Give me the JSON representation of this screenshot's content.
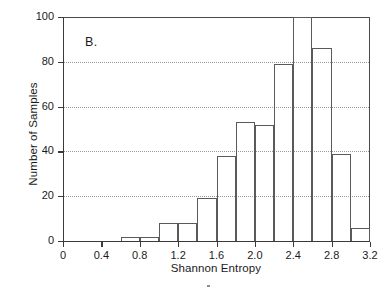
{
  "figure": {
    "panel_letter": "B.",
    "background_color": "#ffffff",
    "line_color": "#5a5a5a",
    "axis_color": "#3a3a3a",
    "grid_color": "#9a9a9a"
  },
  "chart_data": {
    "type": "bar",
    "title": "",
    "subtitle": "",
    "panel_label": "B.",
    "xlabel": "Shannon Entropy",
    "ylabel": "Number of Samples",
    "xlim": [
      0,
      3.2
    ],
    "ylim": [
      0,
      100
    ],
    "grid": true,
    "grid_axis": "y",
    "legend": "none",
    "bin_width": 0.2,
    "histogram_style": "outline-only, unfilled bars",
    "xticks": [
      0,
      0.4,
      0.8,
      1.2,
      1.6,
      2.0,
      2.4,
      2.8,
      3.2
    ],
    "xtick_labels": [
      "0",
      "0.4",
      "0.8",
      "1.2",
      "1.6",
      "2.0",
      "2.4",
      "2.8",
      "3.2"
    ],
    "yticks": [
      0,
      20,
      40,
      60,
      80,
      100
    ],
    "ytick_labels": [
      "0",
      "20",
      "40",
      "60",
      "80",
      "100"
    ],
    "bin_edges": [
      0.6,
      0.8,
      1.0,
      1.2,
      1.4,
      1.6,
      1.8,
      2.0,
      2.2,
      2.4,
      2.6,
      2.8,
      3.0,
      3.2
    ],
    "categories": [
      "0.6-0.8",
      "0.8-1.0",
      "1.0-1.2",
      "1.2-1.4",
      "1.4-1.6",
      "1.6-1.8",
      "1.8-2.0",
      "2.0-2.2",
      "2.2-2.4",
      "2.4-2.6",
      "2.6-2.8",
      "2.8-3.0",
      "3.0-3.2"
    ],
    "values": [
      2,
      2,
      8,
      8,
      19,
      38,
      53,
      52,
      79,
      100,
      86,
      39,
      6
    ],
    "bars": [
      {
        "x0": 0.6,
        "x1": 0.8,
        "value": 2
      },
      {
        "x0": 0.8,
        "x1": 1.0,
        "value": 2
      },
      {
        "x0": 1.0,
        "x1": 1.2,
        "value": 8
      },
      {
        "x0": 1.2,
        "x1": 1.4,
        "value": 8
      },
      {
        "x0": 1.4,
        "x1": 1.6,
        "value": 19
      },
      {
        "x0": 1.6,
        "x1": 1.8,
        "value": 38
      },
      {
        "x0": 1.8,
        "x1": 2.0,
        "value": 53
      },
      {
        "x0": 2.0,
        "x1": 2.2,
        "value": 52
      },
      {
        "x0": 2.2,
        "x1": 2.4,
        "value": 79
      },
      {
        "x0": 2.4,
        "x1": 2.6,
        "value": 100
      },
      {
        "x0": 2.6,
        "x1": 2.8,
        "value": 86
      },
      {
        "x0": 2.8,
        "x1": 3.0,
        "value": 39
      },
      {
        "x0": 3.0,
        "x1": 3.2,
        "value": 6
      }
    ]
  }
}
